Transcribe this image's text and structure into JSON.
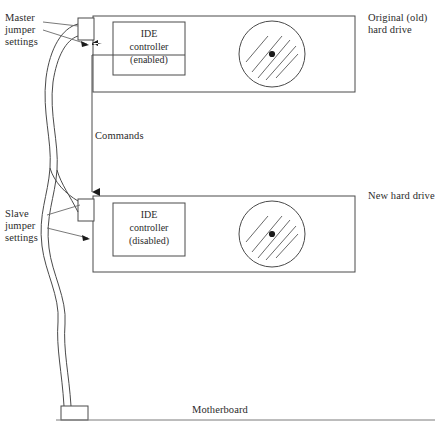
{
  "diagram": {
    "stroke_color": "#4a4a4a",
    "text_color": "#2b2b2b",
    "background": "#ffffff"
  },
  "labels": {
    "master_jumper": "Master\njumper\nsettings",
    "slave_jumper": "Slave\njumper\nsettings",
    "commands": "Commands",
    "original_drive": "Original (old)\nhard drive",
    "new_drive": "New hard drive",
    "motherboard": "Motherboard"
  },
  "drives": [
    {
      "id": "original-drive",
      "side_label": "Original (old)\nhard drive",
      "controller_line1": "IDE",
      "controller_line2": "controller",
      "controller_state": "(enabled)",
      "jumper_label": "Master\njumper\nsettings"
    },
    {
      "id": "new-drive",
      "side_label": "New hard drive",
      "controller_line1": "IDE",
      "controller_line2": "controller",
      "controller_state": "(disabled)",
      "jumper_label": "Slave\njumper\nsettings"
    }
  ]
}
